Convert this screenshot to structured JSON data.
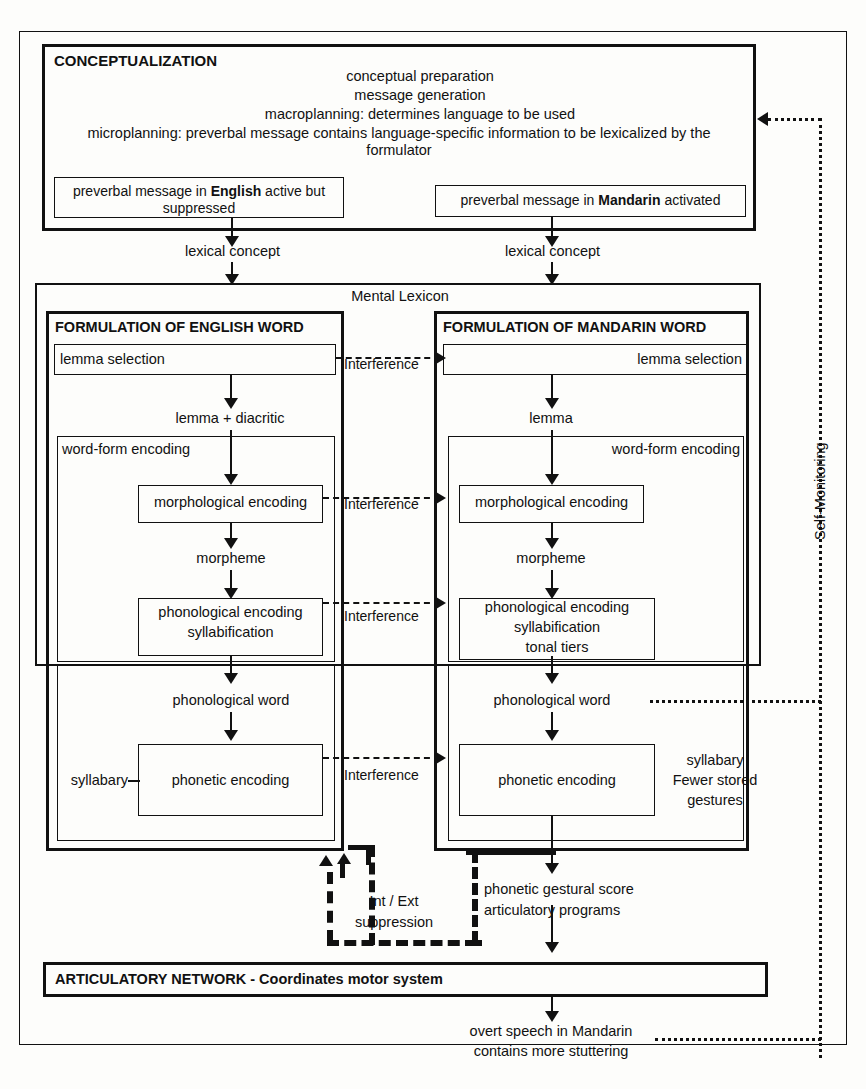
{
  "diagram": {
    "title_conceptualization": "CONCEPTUALIZATION",
    "conceptualization_lines": [
      "conceptual preparation",
      "message generation",
      "macroplanning: determines language to be used",
      "microplanning: preverbal message contains language-specific information to be lexicalized by the formulator"
    ],
    "preverbal_english_pre": "preverbal message in ",
    "preverbal_english_bold": "English",
    "preverbal_english_post": " active but suppressed",
    "preverbal_mandarin_pre": "preverbal message in ",
    "preverbal_mandarin_bold": "Mandarin",
    "preverbal_mandarin_post": " activated",
    "lexical_concept_left": "lexical concept",
    "lexical_concept_right": "lexical concept",
    "mental_lexicon": "Mental Lexicon",
    "english": {
      "title": "FORMULATION OF ENGLISH WORD",
      "lemma_selection": "lemma selection",
      "lemma_label": "lemma + diacritic",
      "word_form_encoding": "word-form encoding",
      "morphological_encoding": "morphological encoding",
      "morpheme": "morpheme",
      "phonological_encoding_line1": "phonological encoding",
      "phonological_encoding_line2": "syllabification",
      "phonological_word": "phonological word",
      "syllabary": "syllabary",
      "phonetic_encoding": "phonetic encoding"
    },
    "mandarin": {
      "title": "FORMULATION OF MANDARIN WORD",
      "lemma_selection": "lemma selection",
      "lemma_label": "lemma",
      "word_form_encoding": "word-form encoding",
      "morphological_encoding": "morphological encoding",
      "morpheme": "morpheme",
      "phonological_encoding_line1": "phonological encoding",
      "phonological_encoding_line2": "syllabification",
      "phonological_encoding_line3": "tonal tiers",
      "phonological_word": "phonological word",
      "phonetic_encoding": "phonetic encoding",
      "syllabary_note_line1": "syllabary",
      "syllabary_note_line2": "Fewer stored",
      "syllabary_note_line3": "gestures"
    },
    "interference_1": "Interference",
    "interference_2": "Interference",
    "interference_3": "Interference",
    "interference_4": "Interference",
    "self_monitoring": "Self-Monitoring",
    "suppression_line1": "Int / Ext",
    "suppression_line2": "suppression",
    "gestural_line1": "phonetic gestural score",
    "gestural_line2": "articulatory programs",
    "articulatory_network": "ARTICULATORY NETWORK - Coordinates motor system",
    "overt_speech_line1": "overt speech in Mandarin",
    "overt_speech_line2": "contains more stuttering"
  }
}
